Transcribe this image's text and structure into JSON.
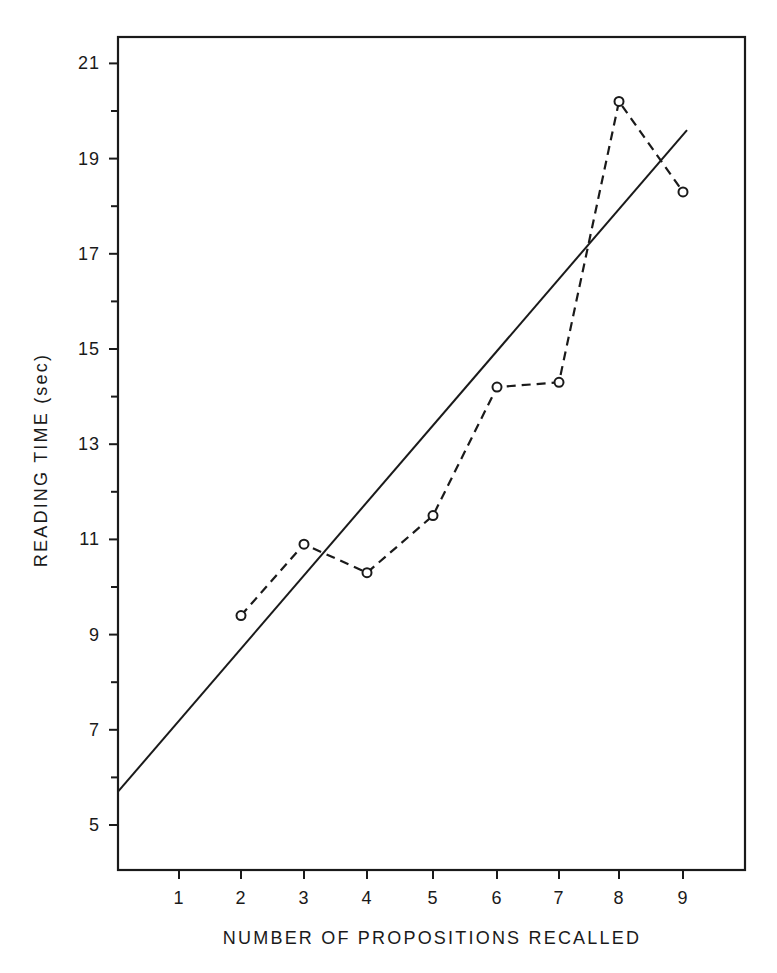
{
  "chart_data": {
    "type": "line",
    "title": "",
    "xlabel": "NUMBER OF PROPOSITIONS RECALLED",
    "ylabel": "READING TIME (sec)",
    "x": [
      2,
      3,
      4,
      5,
      6,
      7,
      8,
      9
    ],
    "x_ticks": [
      1,
      2,
      3,
      4,
      5,
      6,
      7,
      8,
      9
    ],
    "y_ticks": [
      5,
      7,
      9,
      11,
      13,
      15,
      17,
      19,
      21
    ],
    "y_minor_ticks": [
      6,
      8,
      10,
      12,
      14,
      16,
      18,
      20
    ],
    "xlim": [
      0,
      10
    ],
    "ylim": [
      4,
      22.5
    ],
    "grid": false,
    "legend": null,
    "series": [
      {
        "name": "Observed reading time",
        "style": "dashed line with open circle markers",
        "x": [
          2,
          3,
          4,
          5,
          6,
          7,
          8,
          9
        ],
        "values": [
          9.4,
          10.9,
          10.3,
          11.5,
          14.2,
          14.3,
          20.2,
          18.3
        ]
      },
      {
        "name": "Linear fit",
        "style": "solid line",
        "x": [
          0,
          9.1
        ],
        "values": [
          5.7,
          19.6
        ]
      }
    ]
  },
  "axes": {
    "x_label": "NUMBER OF PROPOSITIONS RECALLED",
    "y_label": "READING TIME (sec)"
  }
}
